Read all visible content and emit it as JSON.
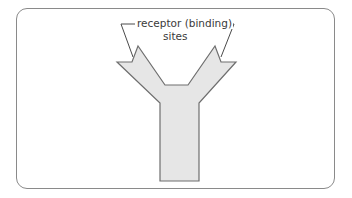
{
  "figure": {
    "type": "antibody-diagram",
    "shape": "Y-shaped molecule",
    "label": {
      "line1": "receptor (binding)",
      "line2": "sites"
    },
    "colors": {
      "fill": "#e6e6e6",
      "stroke": "#6e6e6e",
      "frame": "#8a8a8a",
      "text": "#3a3a3a"
    }
  }
}
